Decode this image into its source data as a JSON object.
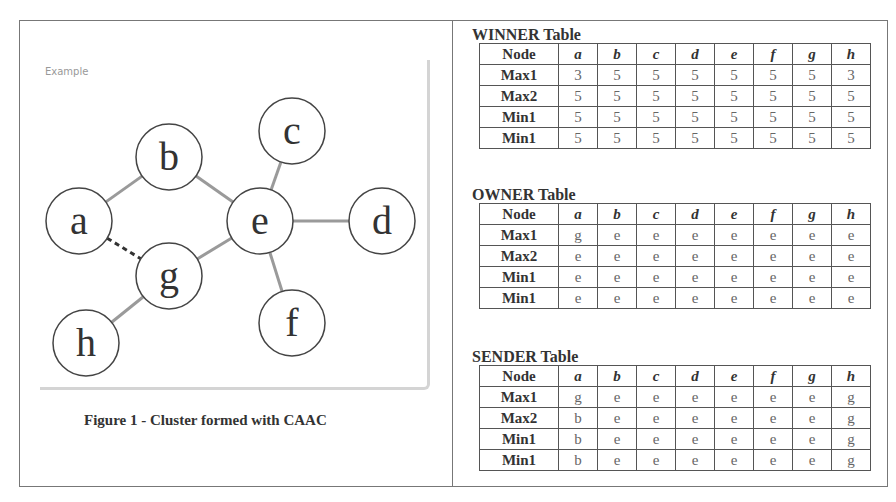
{
  "figure": {
    "example_label": "Example",
    "caption": "Figure 1 - Cluster formed with CAAC",
    "nodes": [
      {
        "id": "a",
        "label": "a",
        "x": 79,
        "y": 221
      },
      {
        "id": "b",
        "label": "b",
        "x": 169,
        "y": 157
      },
      {
        "id": "c",
        "label": "c",
        "x": 292,
        "y": 131
      },
      {
        "id": "d",
        "label": "d",
        "x": 382,
        "y": 221
      },
      {
        "id": "e",
        "label": "e",
        "x": 260,
        "y": 221
      },
      {
        "id": "g",
        "label": "g",
        "x": 169,
        "y": 276
      },
      {
        "id": "f",
        "label": "f",
        "x": 292,
        "y": 323
      },
      {
        "id": "h",
        "label": "h",
        "x": 86,
        "y": 343
      }
    ],
    "edges": [
      {
        "from": "a",
        "to": "b",
        "style": "solid"
      },
      {
        "from": "b",
        "to": "e",
        "style": "solid"
      },
      {
        "from": "c",
        "to": "e",
        "style": "solid"
      },
      {
        "from": "e",
        "to": "d",
        "style": "solid"
      },
      {
        "from": "g",
        "to": "e",
        "style": "solid"
      },
      {
        "from": "e",
        "to": "f",
        "style": "solid"
      },
      {
        "from": "g",
        "to": "h",
        "style": "solid"
      },
      {
        "from": "a",
        "to": "g",
        "style": "dashed"
      }
    ]
  },
  "tables": [
    {
      "title": "WINNER Table",
      "header": [
        "Node",
        "a",
        "b",
        "c",
        "d",
        "e",
        "f",
        "g",
        "h"
      ],
      "rows": [
        [
          "Max1",
          "3",
          "5",
          "5",
          "5",
          "5",
          "5",
          "5",
          "3"
        ],
        [
          "Max2",
          "5",
          "5",
          "5",
          "5",
          "5",
          "5",
          "5",
          "5"
        ],
        [
          "Min1",
          "5",
          "5",
          "5",
          "5",
          "5",
          "5",
          "5",
          "5"
        ],
        [
          "Min1",
          "5",
          "5",
          "5",
          "5",
          "5",
          "5",
          "5",
          "5"
        ]
      ]
    },
    {
      "title": "OWNER Table",
      "header": [
        "Node",
        "a",
        "b",
        "c",
        "d",
        "e",
        "f",
        "g",
        "h"
      ],
      "rows": [
        [
          "Max1",
          "g",
          "e",
          "e",
          "e",
          "e",
          "e",
          "e",
          "e"
        ],
        [
          "Max2",
          "e",
          "e",
          "e",
          "e",
          "e",
          "e",
          "e",
          "e"
        ],
        [
          "Min1",
          "e",
          "e",
          "e",
          "e",
          "e",
          "e",
          "e",
          "e"
        ],
        [
          "Min1",
          "e",
          "e",
          "e",
          "e",
          "e",
          "e",
          "e",
          "e"
        ]
      ]
    },
    {
      "title": "SENDER Table",
      "header": [
        "Node",
        "a",
        "b",
        "c",
        "d",
        "e",
        "f",
        "g",
        "h"
      ],
      "rows": [
        [
          "Max1",
          "g",
          "e",
          "e",
          "e",
          "e",
          "e",
          "e",
          "g"
        ],
        [
          "Max2",
          "b",
          "e",
          "e",
          "e",
          "e",
          "e",
          "e",
          "g"
        ],
        [
          "Min1",
          "b",
          "e",
          "e",
          "e",
          "e",
          "e",
          "e",
          "g"
        ],
        [
          "Min1",
          "b",
          "e",
          "e",
          "e",
          "e",
          "e",
          "e",
          "g"
        ]
      ]
    }
  ]
}
